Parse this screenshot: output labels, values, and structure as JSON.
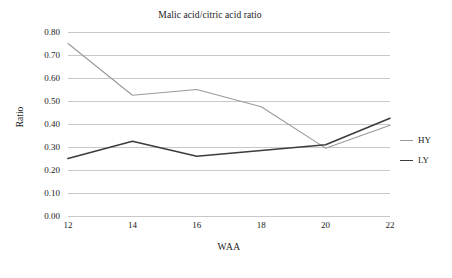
{
  "chart_data": {
    "type": "line",
    "title": "Malic acid/citric acid ratio",
    "xlabel": "WAA",
    "ylabel": "Ratio",
    "x": [
      12,
      14,
      16,
      18,
      20,
      22
    ],
    "categories": [
      "12",
      "14",
      "16",
      "18",
      "20",
      "22"
    ],
    "xlim": [
      12,
      22
    ],
    "ylim": [
      0.0,
      0.8
    ],
    "ytick_labels": [
      "0.80",
      "0.70",
      "0.60",
      "0.50",
      "0.40",
      "0.30",
      "0.20",
      "0.10",
      "0.00"
    ],
    "ytick_values": [
      0.8,
      0.7,
      0.6,
      0.5,
      0.4,
      0.3,
      0.2,
      0.1,
      0.0
    ],
    "grid": true,
    "legend_position": "right",
    "series": [
      {
        "name": "HY",
        "color": "#9a9a9a",
        "values": [
          0.75,
          0.525,
          0.55,
          0.475,
          0.295,
          0.395
        ]
      },
      {
        "name": "LY",
        "color": "#3c3c3c",
        "values": [
          0.25,
          0.325,
          0.26,
          0.285,
          0.31,
          0.425
        ]
      }
    ]
  },
  "colors": {
    "gridline": "#c8c8c8",
    "text": "#1a1a1a",
    "background": "#ffffff"
  }
}
